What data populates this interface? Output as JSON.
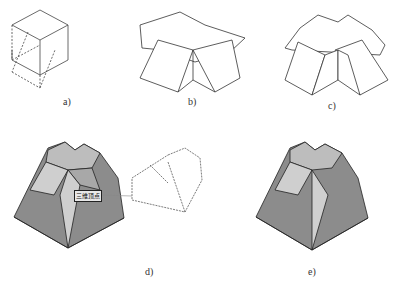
{
  "labels": {
    "a": "a)",
    "b": "b)",
    "c": "c)",
    "d": "d)",
    "e": "e)"
  },
  "tooltip": "三维顶点",
  "colors": {
    "line": "#333333",
    "face_dark": "#8c8c8c",
    "face_mid": "#a8a8a8",
    "face_light": "#cfcfcf",
    "top": "#bdbdbd"
  }
}
